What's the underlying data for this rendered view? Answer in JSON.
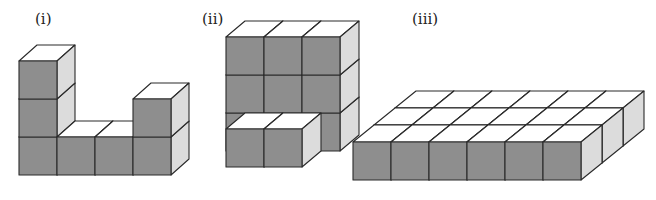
{
  "figures": [
    {
      "label": "(i)",
      "description": "U-shaped arrangement: column of 3 cubes on left, 2 middle base cubes, column of 2 cubes on right",
      "origin": [
        19,
        175
      ],
      "cube": 38,
      "depth": [
        18,
        -16
      ],
      "cubes": [
        [
          0,
          0,
          0
        ],
        [
          0,
          1,
          0
        ],
        [
          0,
          2,
          0
        ],
        [
          1,
          0,
          0
        ],
        [
          2,
          0,
          0
        ],
        [
          3,
          0,
          0
        ],
        [
          3,
          1,
          0
        ]
      ]
    },
    {
      "label": "(ii)",
      "description": "3x3 wall of cubes with a row of 2 cubes placed in front at the bottom",
      "origin": [
        207,
        167
      ],
      "cube": 38,
      "depth": [
        19,
        -16
      ],
      "cubes": [
        [
          0,
          0,
          1
        ],
        [
          1,
          0,
          1
        ],
        [
          2,
          0,
          1
        ],
        [
          0,
          1,
          1
        ],
        [
          1,
          1,
          1
        ],
        [
          2,
          1,
          1
        ],
        [
          0,
          2,
          1
        ],
        [
          1,
          2,
          1
        ],
        [
          2,
          2,
          1
        ],
        [
          0.5,
          0,
          0
        ],
        [
          1.5,
          0,
          0
        ]
      ]
    },
    {
      "label": "(iii)",
      "description": "Flat slab of 6 x 3 cubes, one layer high",
      "origin": [
        353,
        180
      ],
      "cube": 38,
      "depth": [
        21,
        -17
      ],
      "cols": 6,
      "rows": 3
    }
  ],
  "colors": {
    "front": "#8e8e8e",
    "side": "#dcdcdc",
    "top": "#ffffff",
    "edge": "#2a2a2a"
  }
}
